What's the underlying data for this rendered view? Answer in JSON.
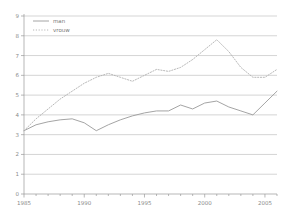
{
  "chart_data": {
    "type": "line",
    "title": "",
    "xlabel": "",
    "ylabel": "",
    "xlim": [
      1985,
      2006
    ],
    "ylim": [
      0,
      9
    ],
    "grid": true,
    "legend_position": "top-left",
    "ytick_labels": [
      "0",
      "1",
      "2",
      "3",
      "4",
      "5",
      "6",
      "7",
      "8",
      "9"
    ],
    "yticks": [
      0,
      1,
      2,
      3,
      4,
      5,
      6,
      7,
      8,
      9
    ],
    "xtick_labels": [
      "1985",
      "1990",
      "1995",
      "2000",
      "2005"
    ],
    "xticks": [
      1985,
      1990,
      1995,
      2000,
      2005
    ],
    "x": [
      1985,
      1986,
      1987,
      1988,
      1989,
      1990,
      1991,
      1992,
      1993,
      1994,
      1995,
      1996,
      1997,
      1998,
      1999,
      2000,
      2001,
      2002,
      2003,
      2004,
      2005,
      2006
    ],
    "series": [
      {
        "name": "man",
        "style": "solid",
        "color": "#9a9a9a",
        "values": [
          3.2,
          3.5,
          3.65,
          3.75,
          3.8,
          3.6,
          3.2,
          3.5,
          3.75,
          3.95,
          4.1,
          4.2,
          4.2,
          4.5,
          4.3,
          4.6,
          4.7,
          4.4,
          4.2,
          4.0,
          4.6,
          5.2
        ]
      },
      {
        "name": "vrouw",
        "style": "dotted",
        "color": "#b0b0b0",
        "values": [
          3.2,
          3.8,
          4.3,
          4.8,
          5.2,
          5.6,
          5.9,
          6.1,
          5.9,
          5.7,
          6.0,
          6.3,
          6.2,
          6.4,
          6.8,
          7.3,
          7.8,
          7.2,
          6.4,
          5.9,
          5.9,
          6.3
        ]
      }
    ]
  },
  "legend": {
    "items": [
      {
        "label": "man"
      },
      {
        "label": "vrouw"
      }
    ]
  }
}
